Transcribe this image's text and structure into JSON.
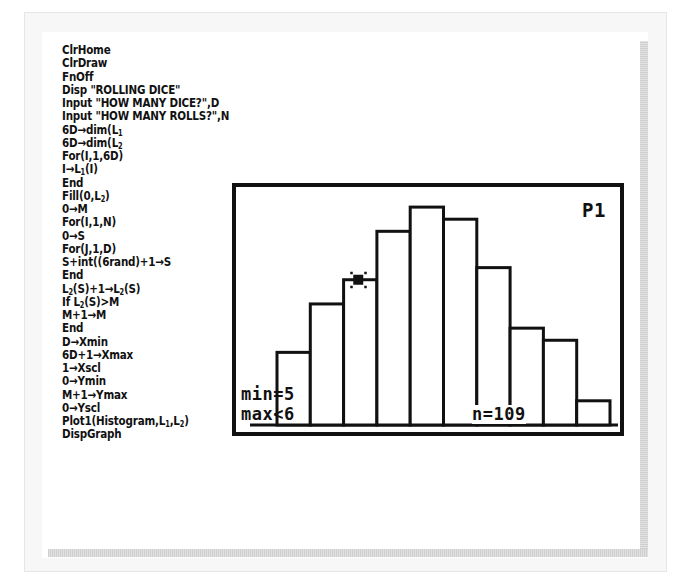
{
  "program": {
    "lines": [
      "ClrHome",
      "ClrDraw",
      "FnOff",
      "Disp \"ROLLING DICE\"",
      "Input \"HOW MANY DICE?\",D",
      "Input \"HOW MANY ROLLS?\",N",
      "6D→dim(L₁",
      "6D→dim(L₂",
      "For(I,1,6D)",
      "I→L₁(I)",
      "End",
      "Fill(0,L₂)",
      "0→M",
      "For(I,1,N)",
      "0→S",
      "For(J,1,D)",
      "S+int((6rand)+1→S",
      "End",
      "L₂(S)+1→L₂(S)",
      "If L₂(S)>M",
      "M+1→M",
      "End",
      "D→Xmin",
      "6D+1→Xmax",
      "1→Xscl",
      "0→Ymin",
      "M+1→Ymax",
      "0→Yscl",
      "Plot1(Histogram,L₁,L₂)",
      "DispGraph"
    ]
  },
  "graph_screen": {
    "plot_label": "P1",
    "trace_min_label": "min=5",
    "trace_max_label": "max<6",
    "n_label": "n=109",
    "cursor_bin_index": 2
  },
  "chart_data": {
    "type": "bar",
    "xlabel": "",
    "ylabel": "",
    "categories": [
      "bin1",
      "bin2",
      "bin3",
      "bin4",
      "bin5",
      "bin6",
      "bin7",
      "bin8",
      "bin9",
      "bin10"
    ],
    "values": [
      6,
      10,
      12,
      16,
      18,
      17,
      13,
      8,
      7,
      2
    ],
    "ylim": [
      0,
      19
    ],
    "grid": false,
    "annotations": [
      "P1",
      "min=5",
      "max<6",
      "n=109"
    ],
    "n": 109
  },
  "colors": {
    "ink": "#111111",
    "frame": "#f7f7f7",
    "shadow": "#d6d6d6"
  }
}
